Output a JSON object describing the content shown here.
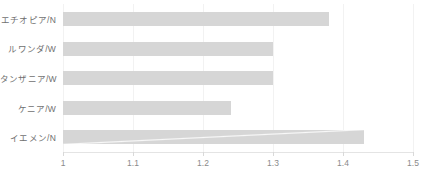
{
  "chart_data": {
    "type": "bar",
    "orientation": "horizontal",
    "title": "",
    "subtitle": "",
    "xlabel": "",
    "ylabel": "",
    "categories": [
      "エチオピア/N",
      "ルワンダ/W",
      "タンザニア/W",
      "ケニア/W",
      "イエメン/N"
    ],
    "values": [
      1.38,
      1.3,
      1.3,
      1.24,
      1.43
    ],
    "series": [
      {
        "name": "",
        "values": [
          1.38,
          1.3,
          1.3,
          1.24,
          1.43
        ]
      }
    ],
    "xlim": [
      1,
      1.5
    ],
    "xticks": [
      1,
      1.1,
      1.2,
      1.3,
      1.4,
      1.5
    ],
    "xticklabels": [
      "1",
      "1.1",
      "1.2",
      "1.3",
      "1.4",
      "1.5"
    ],
    "grid": true,
    "grid_axis": "x",
    "legend": false,
    "legend_position": "none",
    "bar_color": "#d6d6d6",
    "gridline_color": "#f2f2f2",
    "axis_color": "#e4e4e4",
    "label_color": "#6f6f6f",
    "tick_label_color": "#8a8a8a"
  }
}
